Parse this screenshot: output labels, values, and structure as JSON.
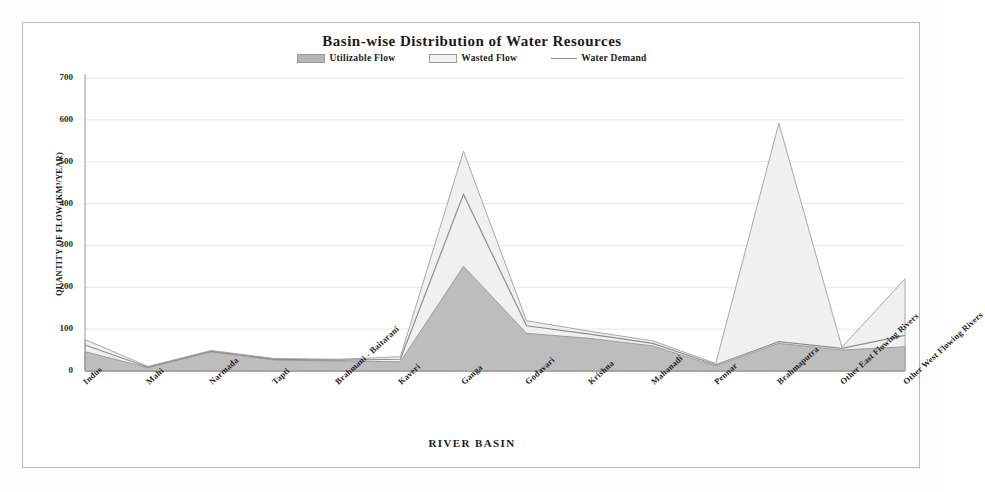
{
  "chart_data": {
    "type": "area",
    "title": "Basin-wise Distribution of Water Resources",
    "xlabel": "RIVER BASIN",
    "ylabel": "QUANTITY OF FLOW (KM³/YEAR)",
    "categories": [
      "Indus",
      "Mahi",
      "Narmada",
      "Tapti",
      "Brahmani - Baitarani",
      "Kaveri",
      "Ganga",
      "Godavari",
      "Krishna",
      "Mahanadi",
      "Pennar",
      "Brahmaputra",
      "Other East Flowing Rivers",
      "Other West Flowing Rivers"
    ],
    "series": [
      {
        "name": "Utilizable Flow",
        "values": [
          46,
          8,
          46,
          26,
          24,
          22,
          250,
          90,
          78,
          60,
          12,
          66,
          50,
          58
        ],
        "color": "#b6b6b6"
      },
      {
        "name": "Wasted Flow",
        "values": [
          75,
          11,
          49,
          30,
          28,
          34,
          525,
          120,
          95,
          72,
          18,
          592,
          57,
          220
        ],
        "color": "#e2e2e2"
      },
      {
        "name": "Water Demand",
        "values": [
          62,
          9,
          47,
          28,
          26,
          28,
          422,
          108,
          88,
          66,
          15,
          70,
          54,
          85
        ],
        "color": "#8e8e8e"
      }
    ],
    "ylim": [
      0,
      700
    ],
    "yticks": [
      0,
      100,
      200,
      300,
      400,
      500,
      600,
      700
    ],
    "grid": true,
    "legend_position": "top",
    "stacked": false
  },
  "legend": {
    "items": [
      {
        "label": "Utilizable Flow",
        "marker": "area-swatch-dark"
      },
      {
        "label": "Wasted Flow",
        "marker": "area-swatch-light"
      },
      {
        "label": "Water Demand",
        "marker": "line-swatch"
      }
    ]
  },
  "colors": {
    "utilizable_fill": "#b6b6b6",
    "wasted_fill": "#e9e9e9",
    "demand_line": "#8e8e8e",
    "grid": "#e6e6e6",
    "axis": "#9a9a9a",
    "frame_border": "#b9b9b9",
    "text": "#1b1b1b"
  }
}
